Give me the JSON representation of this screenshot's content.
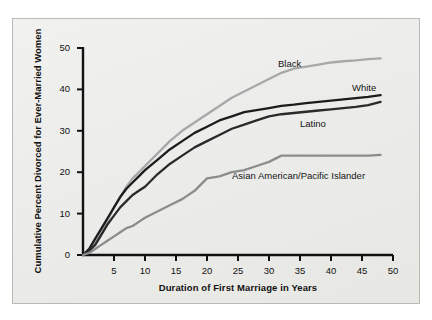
{
  "chart_data": {
    "type": "line",
    "title": "",
    "xlabel": "Duration of First Marriage in Years",
    "ylabel": "Cumulative Percent Divorced for Ever-Married Women",
    "xlim": [
      0,
      50
    ],
    "ylim": [
      0,
      50
    ],
    "xticks": [
      5,
      10,
      15,
      20,
      25,
      30,
      35,
      40,
      45,
      50
    ],
    "yticks": [
      0,
      10,
      20,
      30,
      40,
      50
    ],
    "grid": false,
    "legend_position": "inline-labels",
    "x": [
      0,
      1,
      2,
      3,
      4,
      5,
      6,
      7,
      8,
      9,
      10,
      12,
      14,
      16,
      18,
      20,
      22,
      24,
      26,
      28,
      30,
      32,
      34,
      36,
      38,
      40,
      42,
      44,
      46,
      48
    ],
    "series": [
      {
        "name": "Black",
        "color": "#a8a8a8",
        "values": [
          0,
          1.0,
          3.0,
          5.5,
          8.5,
          11.5,
          14.0,
          16.5,
          18.5,
          20.0,
          21.5,
          24.5,
          27.5,
          30.0,
          32.0,
          34.0,
          36.0,
          38.0,
          39.5,
          41.0,
          42.5,
          44.0,
          45.0,
          45.5,
          46.0,
          46.5,
          46.8,
          47.0,
          47.3,
          47.5
        ],
        "label_position": {
          "x": 278,
          "y": 58
        }
      },
      {
        "name": "White",
        "color": "#1c1c1c",
        "values": [
          0,
          1.5,
          4.0,
          6.5,
          9.0,
          11.5,
          14.0,
          16.0,
          17.5,
          19.0,
          20.5,
          23.0,
          25.5,
          27.5,
          29.5,
          31.0,
          32.5,
          33.5,
          34.5,
          35.0,
          35.5,
          36.0,
          36.3,
          36.7,
          37.0,
          37.3,
          37.6,
          37.9,
          38.2,
          38.6
        ],
        "label_position": {
          "x": 352,
          "y": 82
        }
      },
      {
        "name": "Latino",
        "color": "#2a2a2a",
        "values": [
          0,
          1.0,
          2.5,
          5.0,
          7.5,
          9.5,
          11.5,
          13.0,
          14.5,
          15.5,
          16.5,
          19.5,
          22.0,
          24.0,
          26.0,
          27.5,
          29.0,
          30.5,
          31.5,
          32.5,
          33.5,
          34.0,
          34.3,
          34.6,
          34.9,
          35.2,
          35.5,
          35.8,
          36.2,
          37.0
        ],
        "label_position": {
          "x": 300,
          "y": 118
        }
      },
      {
        "name": "Asian American/Pacific Islander",
        "color": "#8c8c8c",
        "values": [
          0,
          0.5,
          1.5,
          2.5,
          3.5,
          4.5,
          5.5,
          6.5,
          7.0,
          8.0,
          9.0,
          10.5,
          12.0,
          13.5,
          15.5,
          18.5,
          19.0,
          20.0,
          20.5,
          21.5,
          22.5,
          24.0,
          24.0,
          24.0,
          24.0,
          24.0,
          24.0,
          24.0,
          24.0,
          24.2
        ],
        "label_position": {
          "x": 232,
          "y": 170
        }
      }
    ]
  },
  "plot": {
    "axis_color": "#111111",
    "panel_color": "#ececea",
    "frame_border_color": "#b9b9b5"
  }
}
